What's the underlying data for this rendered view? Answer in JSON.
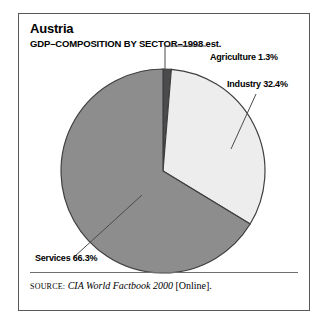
{
  "figure": {
    "title": "Austria",
    "subtitle": "GDP–COMPOSITION BY SECTOR–1998 est.",
    "source": {
      "prefix": "SOURCE:",
      "work": "CIA World Factbook 2000",
      "suffix": "[Online]."
    },
    "border_color": "#58585a",
    "background": "#ffffff"
  },
  "labels": {
    "agriculture": "Agriculture 1.3%",
    "industry": "Industry 32.4%",
    "services": "Services 66.3%"
  },
  "chart_data": {
    "type": "pie",
    "title": "Austria",
    "subtitle": "GDP–COMPOSITION BY SECTOR–1998 est.",
    "xlabel": "",
    "ylabel": "",
    "units": "percent",
    "total": 100.0,
    "start_angle_deg": 0,
    "direction": "clockwise",
    "legend": "none (leader-line callouts)",
    "grid": false,
    "categories": [
      "Agriculture",
      "Industry",
      "Services"
    ],
    "values": [
      1.3,
      32.4,
      66.3
    ],
    "slices": [
      {
        "name": "Agriculture",
        "value": 1.3,
        "label": "Agriculture 1.3%",
        "color": "#4b4b4d",
        "start_deg": 0.0,
        "end_deg": 4.68
      },
      {
        "name": "Industry",
        "value": 32.4,
        "label": "Industry 32.4%",
        "color": "#ededed",
        "start_deg": 4.68,
        "end_deg": 121.32
      },
      {
        "name": "Services",
        "value": 66.3,
        "label": "Services 66.3%",
        "color": "#8d8d8d",
        "start_deg": 121.32,
        "end_deg": 360.0
      }
    ]
  }
}
